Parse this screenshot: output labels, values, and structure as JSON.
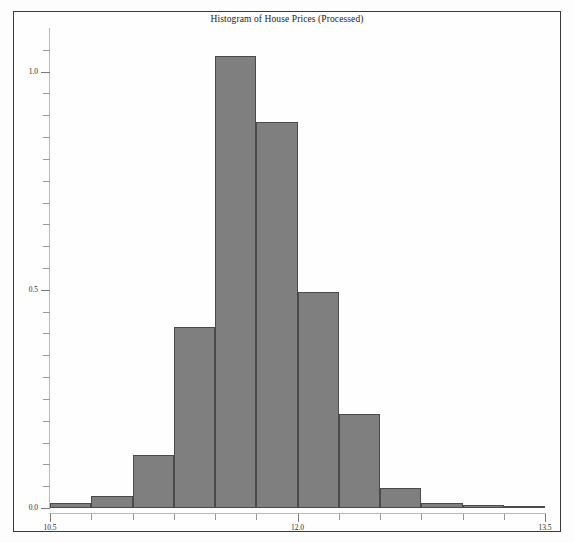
{
  "figure": {
    "title": "Histogram of House Prices (Processed)",
    "background_color": "#fdfdfd",
    "frame_color": "#3a3a3a",
    "bar_fill_color": "#7f7f7f",
    "bar_edge_color": "#4a4a4a",
    "axis_color": "#b9b9b9"
  },
  "chart_data": {
    "type": "bar",
    "subtype": "histogram",
    "title": "Histogram of House Prices (Processed)",
    "xlabel": "",
    "ylabel": "",
    "xlim": [
      10.5,
      13.5
    ],
    "ylim": [
      0.0,
      1.1
    ],
    "grid": false,
    "legend": false,
    "legend_position": "none",
    "normalized": true,
    "bin_width": 0.25,
    "x_tick_labels": [
      "10.5",
      "12.0",
      "13.5"
    ],
    "x_tick_values": [
      10.5,
      12.0,
      13.5
    ],
    "x_minor_tick_values": [
      10.75,
      11.0,
      11.25,
      11.5,
      11.75,
      12.25,
      12.5,
      12.75,
      13.0,
      13.25
    ],
    "y_tick_labels": [
      "0.0",
      "0.5",
      "1.0"
    ],
    "y_tick_values": [
      0.0,
      0.5,
      1.0
    ],
    "y_minor_tick_values": [
      0.05,
      0.1,
      0.15,
      0.2,
      0.25,
      0.3,
      0.35,
      0.4,
      0.45,
      0.55,
      0.6,
      0.65,
      0.7,
      0.75,
      0.8,
      0.85,
      0.9,
      0.95,
      1.05
    ],
    "bin_edges": [
      10.5,
      10.75,
      11.0,
      11.25,
      11.5,
      11.75,
      12.0,
      12.25,
      12.5,
      12.75,
      13.0,
      13.25,
      13.5
    ],
    "categories": [
      "10.5-10.75",
      "10.75-11.0",
      "11.0-11.25",
      "11.25-11.5",
      "11.5-11.75",
      "11.75-12.0",
      "12.0-12.25",
      "12.25-12.5",
      "12.5-12.75",
      "12.75-13.0",
      "13.0-13.25",
      "13.25-13.5"
    ],
    "values": [
      0.011,
      0.028,
      0.122,
      0.415,
      1.035,
      0.885,
      0.495,
      0.215,
      0.045,
      0.012,
      0.006,
      0.004
    ],
    "bars": [
      {
        "label": "10.5-10.75",
        "x0": 10.5,
        "x1": 10.75,
        "value": 0.011
      },
      {
        "label": "10.75-11.0",
        "x0": 10.75,
        "x1": 11.0,
        "value": 0.028
      },
      {
        "label": "11.0-11.25",
        "x0": 11.0,
        "x1": 11.25,
        "value": 0.122
      },
      {
        "label": "11.25-11.5",
        "x0": 11.25,
        "x1": 11.5,
        "value": 0.415
      },
      {
        "label": "11.5-11.75",
        "x0": 11.5,
        "x1": 11.75,
        "value": 1.035
      },
      {
        "label": "11.75-12.0",
        "x0": 11.75,
        "x1": 12.0,
        "value": 0.885
      },
      {
        "label": "12.0-12.25",
        "x0": 12.0,
        "x1": 12.25,
        "value": 0.495
      },
      {
        "label": "12.25-12.5",
        "x0": 12.25,
        "x1": 12.5,
        "value": 0.215
      },
      {
        "label": "12.5-12.75",
        "x0": 12.5,
        "x1": 12.75,
        "value": 0.045
      },
      {
        "label": "12.75-13.0",
        "x0": 12.75,
        "x1": 13.0,
        "value": 0.012
      },
      {
        "label": "13.0-13.25",
        "x0": 13.0,
        "x1": 13.25,
        "value": 0.006
      },
      {
        "label": "13.25-13.5",
        "x0": 13.25,
        "x1": 13.5,
        "value": 0.004
      }
    ]
  }
}
